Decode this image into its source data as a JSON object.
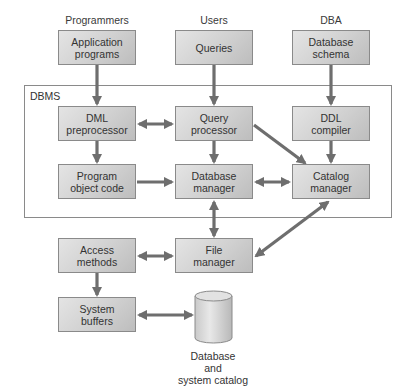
{
  "diagram": {
    "actors": {
      "programmers": "Programmers",
      "users": "Users",
      "dba": "DBA"
    },
    "frame_label": "DBMS",
    "boxes": {
      "application_programs": "Application\nprograms",
      "queries": "Queries",
      "database_schema": "Database\nschema",
      "dml_preprocessor": "DML\npreprocessor",
      "query_processor": "Query\nprocessor",
      "ddl_compiler": "DDL\ncompiler",
      "program_object_code": "Program\nobject code",
      "database_manager": "Database\nmanager",
      "catalog_manager": "Catalog\nmanager",
      "access_methods": "Access\nmethods",
      "file_manager": "File\nmanager",
      "system_buffers": "System\nbuffers"
    },
    "storage": {
      "caption": "Database\nand\nsystem catalog"
    },
    "edges": [
      {
        "from": "application_programs",
        "to": "dml_preprocessor",
        "type": "one-way"
      },
      {
        "from": "queries",
        "to": "query_processor",
        "type": "one-way"
      },
      {
        "from": "database_schema",
        "to": "ddl_compiler",
        "type": "one-way"
      },
      {
        "from": "dml_preprocessor",
        "to": "query_processor",
        "type": "two-way"
      },
      {
        "from": "dml_preprocessor",
        "to": "program_object_code",
        "type": "one-way"
      },
      {
        "from": "query_processor",
        "to": "database_manager",
        "type": "one-way"
      },
      {
        "from": "query_processor",
        "to": "catalog_manager",
        "type": "one-way"
      },
      {
        "from": "ddl_compiler",
        "to": "catalog_manager",
        "type": "one-way"
      },
      {
        "from": "program_object_code",
        "to": "database_manager",
        "type": "one-way"
      },
      {
        "from": "database_manager",
        "to": "catalog_manager",
        "type": "two-way"
      },
      {
        "from": "database_manager",
        "to": "file_manager",
        "type": "two-way"
      },
      {
        "from": "catalog_manager",
        "to": "file_manager",
        "type": "two-way"
      },
      {
        "from": "access_methods",
        "to": "file_manager",
        "type": "two-way"
      },
      {
        "from": "access_methods",
        "to": "system_buffers",
        "type": "one-way"
      },
      {
        "from": "system_buffers",
        "to": "database_and_system_catalog",
        "type": "two-way"
      }
    ],
    "colors": {
      "box_border": "#8a8a8a",
      "box_fill_light": "#e4e4e4",
      "box_fill_dark": "#bdbdbd",
      "arrow": "#6e6e6e",
      "frame": "#8a8a8a"
    }
  }
}
